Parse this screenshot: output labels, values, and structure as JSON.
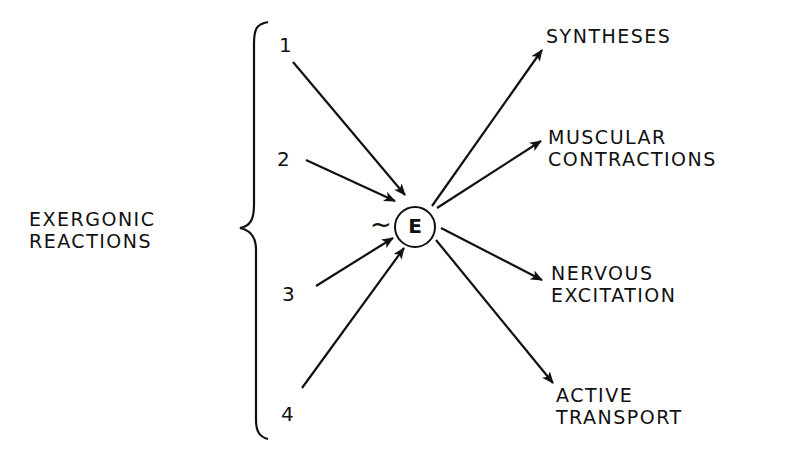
{
  "diagram": {
    "source_group": {
      "label_line1": "EXERGONIC",
      "label_line2": "REACTIONS",
      "reactions": [
        "1",
        "2",
        "3",
        "4"
      ]
    },
    "center": {
      "symbol": "~",
      "label": "E"
    },
    "outputs": [
      {
        "line1": "SYNTHESES",
        "line2": ""
      },
      {
        "line1": "MUSCULAR",
        "line2": "CONTRACTIONS"
      },
      {
        "line1": "NERVOUS",
        "line2": "EXCITATION"
      },
      {
        "line1": "ACTIVE",
        "line2": "TRANSPORT"
      }
    ],
    "colors": {
      "ink": "#111111",
      "background": "#ffffff"
    }
  }
}
